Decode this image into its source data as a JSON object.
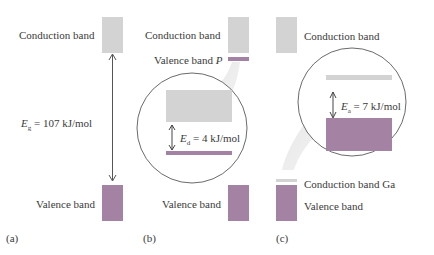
{
  "panels": {
    "a": {
      "tag": "(a)",
      "conduction_label": "Conduction band",
      "valence_label": "Valence band",
      "gap": {
        "symbol": "E",
        "subscript": "g",
        "rest": " = 107 kJ/mol"
      }
    },
    "b": {
      "tag": "(b)",
      "conduction_label": "Conduction band",
      "donor_label_prefix": "Valence band ",
      "donor_label_italic": "P",
      "valence_label": "Valence band",
      "gap": {
        "symbol": "E",
        "subscript": "d",
        "rest": " = 4 kJ/mol"
      }
    },
    "c": {
      "tag": "(c)",
      "conduction_label": "Conduction band",
      "acceptor_label": "Conduction band Ga",
      "valence_label": "Valence band",
      "gap": {
        "symbol": "E",
        "subscript": "a",
        "rest": " = 7 kJ/mol"
      }
    }
  },
  "colors": {
    "conduction": "#d3d3d3",
    "valence": "#a382a3",
    "text": "#3a3a3a",
    "outline": "#444444"
  }
}
